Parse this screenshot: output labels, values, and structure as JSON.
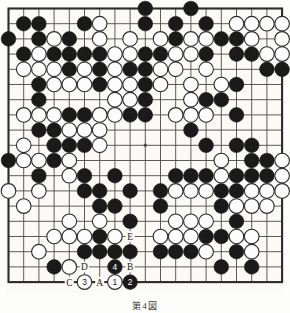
{
  "diagram": {
    "type": "go-board",
    "size": 19,
    "caption": "第4図",
    "board_colors": {
      "background": "#fbfaf7",
      "line": "#4a4a4a",
      "border": "#2b2b2b",
      "black_stone": "#1a1a1a",
      "white_stone": "#fdfdfd",
      "white_stone_outline": "#2b2b2b",
      "label_text": "#1a1a1a"
    },
    "star_points": [
      {
        "col": 3,
        "row": 3
      },
      {
        "col": 9,
        "row": 3
      },
      {
        "col": 15,
        "row": 3
      },
      {
        "col": 3,
        "row": 9
      },
      {
        "col": 9,
        "row": 9
      },
      {
        "col": 15,
        "row": 9
      },
      {
        "col": 3,
        "row": 15
      },
      {
        "col": 9,
        "row": 15
      },
      {
        "col": 15,
        "row": 15
      }
    ],
    "visible_star_points": [
      {
        "col": 9,
        "row": 9
      }
    ],
    "black_stones": [
      {
        "col": 9,
        "row": 0
      },
      {
        "col": 12,
        "row": 0
      },
      {
        "col": 1,
        "row": 1
      },
      {
        "col": 2,
        "row": 1
      },
      {
        "col": 5,
        "row": 1
      },
      {
        "col": 9,
        "row": 1
      },
      {
        "col": 11,
        "row": 1
      },
      {
        "col": 13,
        "row": 1
      },
      {
        "col": 0,
        "row": 2
      },
      {
        "col": 2,
        "row": 2
      },
      {
        "col": 4,
        "row": 2
      },
      {
        "col": 11,
        "row": 2
      },
      {
        "col": 14,
        "row": 2
      },
      {
        "col": 15,
        "row": 2
      },
      {
        "col": 1,
        "row": 3
      },
      {
        "col": 3,
        "row": 3
      },
      {
        "col": 4,
        "row": 3
      },
      {
        "col": 5,
        "row": 3
      },
      {
        "col": 6,
        "row": 3
      },
      {
        "col": 9,
        "row": 3
      },
      {
        "col": 10,
        "row": 3
      },
      {
        "col": 13,
        "row": 3
      },
      {
        "col": 15,
        "row": 3
      },
      {
        "col": 16,
        "row": 3
      },
      {
        "col": 4,
        "row": 4
      },
      {
        "col": 6,
        "row": 4
      },
      {
        "col": 8,
        "row": 4
      },
      {
        "col": 9,
        "row": 4
      },
      {
        "col": 17,
        "row": 4
      },
      {
        "col": 18,
        "row": 4
      },
      {
        "col": 2,
        "row": 5
      },
      {
        "col": 6,
        "row": 5
      },
      {
        "col": 9,
        "row": 5
      },
      {
        "col": 15,
        "row": 5
      },
      {
        "col": 2,
        "row": 6
      },
      {
        "col": 9,
        "row": 6
      },
      {
        "col": 13,
        "row": 6
      },
      {
        "col": 14,
        "row": 6
      },
      {
        "col": 4,
        "row": 7
      },
      {
        "col": 5,
        "row": 7
      },
      {
        "col": 8,
        "row": 7
      },
      {
        "col": 9,
        "row": 7
      },
      {
        "col": 15,
        "row": 7
      },
      {
        "col": 2,
        "row": 8
      },
      {
        "col": 3,
        "row": 8
      },
      {
        "col": 12,
        "row": 8
      },
      {
        "col": 3,
        "row": 9
      },
      {
        "col": 4,
        "row": 9
      },
      {
        "col": 5,
        "row": 9
      },
      {
        "col": 13,
        "row": 9
      },
      {
        "col": 15,
        "row": 9
      },
      {
        "col": 16,
        "row": 9
      },
      {
        "col": 0,
        "row": 10
      },
      {
        "col": 3,
        "row": 10
      },
      {
        "col": 16,
        "row": 10
      },
      {
        "col": 17,
        "row": 10
      },
      {
        "col": 2,
        "row": 11
      },
      {
        "col": 5,
        "row": 11
      },
      {
        "col": 7,
        "row": 11
      },
      {
        "col": 11,
        "row": 11
      },
      {
        "col": 12,
        "row": 11
      },
      {
        "col": 13,
        "row": 11
      },
      {
        "col": 15,
        "row": 11
      },
      {
        "col": 16,
        "row": 11
      },
      {
        "col": 17,
        "row": 11
      },
      {
        "col": 5,
        "row": 12
      },
      {
        "col": 6,
        "row": 12
      },
      {
        "col": 8,
        "row": 12
      },
      {
        "col": 10,
        "row": 12
      },
      {
        "col": 14,
        "row": 12
      },
      {
        "col": 15,
        "row": 12
      },
      {
        "col": 6,
        "row": 13
      },
      {
        "col": 7,
        "row": 13
      },
      {
        "col": 10,
        "row": 13
      },
      {
        "col": 14,
        "row": 13
      },
      {
        "col": 8,
        "row": 14
      },
      {
        "col": 15,
        "row": 14
      },
      {
        "col": 6,
        "row": 15
      },
      {
        "col": 13,
        "row": 15
      },
      {
        "col": 14,
        "row": 15
      },
      {
        "col": 5,
        "row": 16
      },
      {
        "col": 6,
        "row": 16
      },
      {
        "col": 7,
        "row": 16
      },
      {
        "col": 8,
        "row": 16
      },
      {
        "col": 10,
        "row": 16
      },
      {
        "col": 11,
        "row": 16
      },
      {
        "col": 12,
        "row": 16
      },
      {
        "col": 15,
        "row": 16
      },
      {
        "col": 3,
        "row": 17
      },
      {
        "col": 14,
        "row": 17
      },
      {
        "col": 16,
        "row": 17
      }
    ],
    "white_stones": [
      {
        "col": 6,
        "row": 1
      },
      {
        "col": 15,
        "row": 1
      },
      {
        "col": 16,
        "row": 1
      },
      {
        "col": 17,
        "row": 1
      },
      {
        "col": 18,
        "row": 1
      },
      {
        "col": 3,
        "row": 2
      },
      {
        "col": 6,
        "row": 2
      },
      {
        "col": 8,
        "row": 2
      },
      {
        "col": 10,
        "row": 2
      },
      {
        "col": 12,
        "row": 2
      },
      {
        "col": 13,
        "row": 2
      },
      {
        "col": 16,
        "row": 2
      },
      {
        "col": 18,
        "row": 2
      },
      {
        "col": 2,
        "row": 3
      },
      {
        "col": 7,
        "row": 3
      },
      {
        "col": 8,
        "row": 3
      },
      {
        "col": 11,
        "row": 3
      },
      {
        "col": 12,
        "row": 3
      },
      {
        "col": 17,
        "row": 3
      },
      {
        "col": 18,
        "row": 3
      },
      {
        "col": 1,
        "row": 4
      },
      {
        "col": 2,
        "row": 4
      },
      {
        "col": 3,
        "row": 4
      },
      {
        "col": 5,
        "row": 4
      },
      {
        "col": 7,
        "row": 4
      },
      {
        "col": 10,
        "row": 4
      },
      {
        "col": 11,
        "row": 4
      },
      {
        "col": 13,
        "row": 4
      },
      {
        "col": 3,
        "row": 5
      },
      {
        "col": 4,
        "row": 5
      },
      {
        "col": 5,
        "row": 5
      },
      {
        "col": 7,
        "row": 5
      },
      {
        "col": 8,
        "row": 5
      },
      {
        "col": 10,
        "row": 5
      },
      {
        "col": 12,
        "row": 5
      },
      {
        "col": 14,
        "row": 5
      },
      {
        "col": 7,
        "row": 6
      },
      {
        "col": 8,
        "row": 6
      },
      {
        "col": 12,
        "row": 6
      },
      {
        "col": 1,
        "row": 7
      },
      {
        "col": 2,
        "row": 7
      },
      {
        "col": 3,
        "row": 7
      },
      {
        "col": 6,
        "row": 7
      },
      {
        "col": 7,
        "row": 7
      },
      {
        "col": 11,
        "row": 7
      },
      {
        "col": 12,
        "row": 7
      },
      {
        "col": 13,
        "row": 7
      },
      {
        "col": 4,
        "row": 8
      },
      {
        "col": 5,
        "row": 8
      },
      {
        "col": 6,
        "row": 8
      },
      {
        "col": 1,
        "row": 9
      },
      {
        "col": 6,
        "row": 9
      },
      {
        "col": 1,
        "row": 10
      },
      {
        "col": 2,
        "row": 10
      },
      {
        "col": 4,
        "row": 10
      },
      {
        "col": 14,
        "row": 10
      },
      {
        "col": 18,
        "row": 10
      },
      {
        "col": 4,
        "row": 11
      },
      {
        "col": 14,
        "row": 11
      },
      {
        "col": 18,
        "row": 11
      },
      {
        "col": 0,
        "row": 12
      },
      {
        "col": 2,
        "row": 12
      },
      {
        "col": 11,
        "row": 12
      },
      {
        "col": 12,
        "row": 12
      },
      {
        "col": 13,
        "row": 12
      },
      {
        "col": 16,
        "row": 12
      },
      {
        "col": 17,
        "row": 12
      },
      {
        "col": 18,
        "row": 12
      },
      {
        "col": 1,
        "row": 13
      },
      {
        "col": 15,
        "row": 13
      },
      {
        "col": 16,
        "row": 13
      },
      {
        "col": 17,
        "row": 13
      },
      {
        "col": 4,
        "row": 14
      },
      {
        "col": 6,
        "row": 14
      },
      {
        "col": 11,
        "row": 14
      },
      {
        "col": 12,
        "row": 14
      },
      {
        "col": 13,
        "row": 14
      },
      {
        "col": 3,
        "row": 15
      },
      {
        "col": 4,
        "row": 15
      },
      {
        "col": 5,
        "row": 15
      },
      {
        "col": 7,
        "row": 15
      },
      {
        "col": 10,
        "row": 15
      },
      {
        "col": 11,
        "row": 15
      },
      {
        "col": 12,
        "row": 15
      },
      {
        "col": 15,
        "row": 15
      },
      {
        "col": 16,
        "row": 15
      },
      {
        "col": 2,
        "row": 16
      },
      {
        "col": 13,
        "row": 16
      },
      {
        "col": 16,
        "row": 16
      },
      {
        "col": 4,
        "row": 17
      }
    ],
    "numbered_moves": [
      {
        "number": "1",
        "color": "white",
        "col": 7,
        "row": 18
      },
      {
        "number": "2",
        "color": "black",
        "col": 8,
        "row": 18
      },
      {
        "number": "3",
        "color": "white",
        "col": 5,
        "row": 18
      },
      {
        "number": "4",
        "color": "black",
        "col": 7,
        "row": 17
      }
    ],
    "letter_labels": [
      {
        "letter": "A",
        "col": 6,
        "row": 18
      },
      {
        "letter": "B",
        "col": 8,
        "row": 17
      },
      {
        "letter": "C",
        "col": 4,
        "row": 18
      },
      {
        "letter": "D",
        "col": 5,
        "row": 17
      },
      {
        "letter": "E",
        "col": 8,
        "row": 15
      }
    ]
  }
}
